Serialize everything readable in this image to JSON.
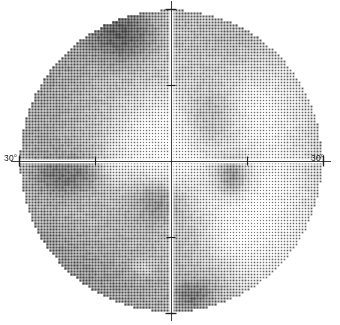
{
  "plot": {
    "name": "visual-field-grayscale",
    "axis_labels": {
      "left": "30°",
      "right": "30°"
    },
    "background_color": "#ffffff",
    "ink_color": "#1a1a1a",
    "axis_color": "#ffffff"
  },
  "chart_data": {
    "type": "heatmap",
    "title": "",
    "subtitle": "",
    "xlabel": "",
    "ylabel": "",
    "xlim": [
      -30,
      30
    ],
    "ylim": [
      -30,
      30
    ],
    "grid": false,
    "legend": null,
    "colormap": "grayscale-stipple",
    "axis_ticks_x": [
      -30,
      -15,
      0,
      15,
      30
    ],
    "axis_ticks_y": [
      -30,
      -15,
      0,
      15,
      30
    ],
    "tick_labels_x": [
      "30°",
      "",
      "",
      "",
      "30°"
    ],
    "tick_labels_y": [
      "",
      "",
      "",
      "",
      ""
    ],
    "field_radius_deg": 30,
    "cell_size_deg": 1.0,
    "value_unit": "dB loss",
    "value_range": [
      0,
      32
    ],
    "blobs": [
      {
        "name": "superior-nasal-dense-defect",
        "cx": -0.32,
        "cy": 0.8,
        "rx": 0.2,
        "ry": 0.17,
        "level": 30
      },
      {
        "name": "superior-arcuate-depression",
        "cx": -0.5,
        "cy": 0.52,
        "rx": 0.46,
        "ry": 0.36,
        "level": 17
      },
      {
        "name": "superior-temporal-depression",
        "cx": 0.22,
        "cy": 0.66,
        "rx": 0.4,
        "ry": 0.26,
        "level": 14
      },
      {
        "name": "supero-temporal-blob",
        "cx": 0.25,
        "cy": 0.3,
        "rx": 0.18,
        "ry": 0.2,
        "level": 19
      },
      {
        "name": "nasal-step-dense-defect",
        "cx": -0.68,
        "cy": -0.09,
        "rx": 0.18,
        "ry": 0.13,
        "level": 31
      },
      {
        "name": "nasal-mid-depression",
        "cx": -0.7,
        "cy": 0.12,
        "rx": 0.26,
        "ry": 0.3,
        "level": 18
      },
      {
        "name": "blind-spot",
        "cx": 0.4,
        "cy": -0.1,
        "rx": 0.085,
        "ry": 0.105,
        "level": 32
      },
      {
        "name": "blind-spot-halo",
        "cx": 0.4,
        "cy": -0.1,
        "rx": 0.16,
        "ry": 0.18,
        "level": 13
      },
      {
        "name": "inferior-nasal-depression",
        "cx": -0.55,
        "cy": -0.52,
        "rx": 0.45,
        "ry": 0.4,
        "level": 18
      },
      {
        "name": "paracentral-inferior-defect",
        "cx": -0.1,
        "cy": -0.29,
        "rx": 0.14,
        "ry": 0.12,
        "level": 26
      },
      {
        "name": "inferior-arcuate-depression",
        "cx": -0.13,
        "cy": -0.45,
        "rx": 0.34,
        "ry": 0.26,
        "level": 15
      },
      {
        "name": "inferior-mid-depression",
        "cx": -0.22,
        "cy": -0.72,
        "rx": 0.42,
        "ry": 0.26,
        "level": 17
      },
      {
        "name": "inferior-temporal-dense-defect",
        "cx": 0.14,
        "cy": -0.87,
        "rx": 0.11,
        "ry": 0.09,
        "level": 29
      },
      {
        "name": "inferior-temporal-depression",
        "cx": 0.16,
        "cy": -0.8,
        "rx": 0.24,
        "ry": 0.18,
        "level": 14
      },
      {
        "name": "inferior-central-depression",
        "cx": 0.02,
        "cy": -0.56,
        "rx": 0.22,
        "ry": 0.2,
        "level": 13
      },
      {
        "name": "central-island-normal",
        "cx": -0.08,
        "cy": 0.2,
        "rx": 0.34,
        "ry": 0.3,
        "level": 1
      },
      {
        "name": "temporal-island-normal",
        "cx": 0.62,
        "cy": -0.45,
        "rx": 0.4,
        "ry": 0.42,
        "level": 0
      },
      {
        "name": "superior-temporal-normal",
        "cx": 0.66,
        "cy": 0.4,
        "rx": 0.3,
        "ry": 0.32,
        "level": 2
      },
      {
        "name": "inferior-small-light-island",
        "cx": -0.18,
        "cy": -0.7,
        "rx": 0.07,
        "ry": 0.06,
        "level": 1
      },
      {
        "name": "nasal-light-island",
        "cx": -0.35,
        "cy": -0.05,
        "rx": 0.1,
        "ry": 0.08,
        "level": 6
      }
    ],
    "base_level": 8,
    "annotations": [
      {
        "name": "axis-label-left",
        "text": "30°",
        "x": -34,
        "y": 0
      },
      {
        "name": "axis-label-right",
        "text": "30°",
        "x": 34,
        "y": 0
      }
    ]
  }
}
